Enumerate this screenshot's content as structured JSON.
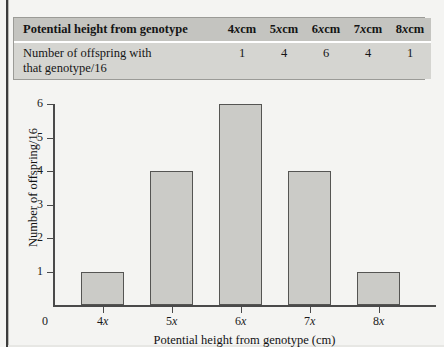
{
  "table": {
    "header": {
      "row_label": "Potential height from genotype",
      "columns": [
        "4xcm",
        "5xcm",
        "6xcm",
        "7xcm",
        "8xcm"
      ],
      "column_prefixes": [
        "4",
        "5",
        "6",
        "7",
        "8"
      ],
      "column_italic": "x",
      "column_suffix": "cm"
    },
    "body": {
      "row_label_line1": "Number of offspring with",
      "row_label_line2": "that genotype/16",
      "values": [
        "1",
        "4",
        "6",
        "4",
        "1"
      ]
    }
  },
  "chart_data": {
    "type": "bar",
    "title": "",
    "xlabel": "Potential height from genotype (cm)",
    "ylabel": "Number of offspring/16",
    "categories": [
      "4x",
      "5x",
      "6x",
      "7x",
      "8x"
    ],
    "category_prefixes": [
      "4",
      "5",
      "6",
      "7",
      "8"
    ],
    "category_italic": "x",
    "values": [
      1,
      4,
      6,
      4,
      1
    ],
    "ylim": [
      0,
      6
    ],
    "yticks": [
      1,
      2,
      3,
      4,
      5,
      6
    ],
    "ytick_labels": [
      "1",
      "2",
      "3",
      "4",
      "5",
      "6"
    ],
    "origin_label": "0",
    "grid": false,
    "legend": false,
    "bar_fill": "#cbcbc7",
    "bar_stroke": "#555553",
    "axis_color": "#4a4a4a"
  }
}
